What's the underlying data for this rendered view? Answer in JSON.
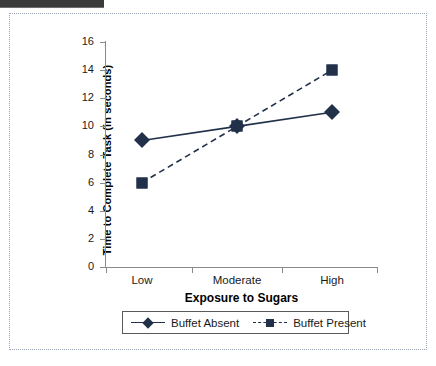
{
  "chart_data": {
    "type": "line",
    "title": "",
    "xlabel": "Exposure to Sugars",
    "ylabel": "Time to Complete Task (in seconds)",
    "categories": [
      "Low",
      "Moderate",
      "High"
    ],
    "ylim": [
      0,
      16
    ],
    "yticks": [
      0,
      2,
      4,
      6,
      8,
      10,
      12,
      14,
      16
    ],
    "ytick_labels": [
      "0",
      "2",
      "4",
      "6",
      "8",
      "10",
      "12",
      "14",
      "16"
    ],
    "grid": false,
    "legend_position": "below-axis",
    "series": [
      {
        "name": "Buffet Absent",
        "values": [
          9,
          10,
          11
        ],
        "marker": "diamond",
        "linestyle": "solid",
        "color": "#22314a"
      },
      {
        "name": "Buffet Present",
        "values": [
          6,
          10,
          14
        ],
        "marker": "square",
        "linestyle": "dashed",
        "color": "#22314a"
      }
    ]
  },
  "legend": {
    "entries": [
      {
        "label": "Buffet Absent",
        "marker": "diamond-marker-icon",
        "linestyle": "solid"
      },
      {
        "label": "Buffet Present",
        "marker": "square-marker-icon",
        "linestyle": "dashed"
      }
    ]
  },
  "colors": {
    "series": "#22314a",
    "axis": "#8a8a8a",
    "text": "#1a1a1a",
    "frame": "#9aa4b4",
    "header_strip": "#3b3b3b"
  }
}
